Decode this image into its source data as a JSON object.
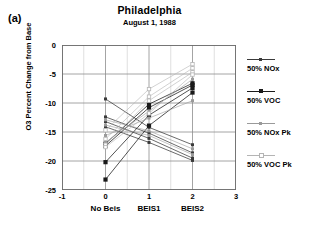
{
  "panel_label": "(a)",
  "chart_data": {
    "type": "line",
    "title": "Philadelphia",
    "subtitle": "August 1, 1988",
    "xlabel": "",
    "ylabel": "O3 Percent Change from Base",
    "xlim": [
      -1,
      3
    ],
    "ylim": [
      -25,
      0
    ],
    "xticks": [
      -1,
      0,
      1,
      2,
      3
    ],
    "xtick_labels": [
      "-1",
      "0",
      "1",
      "2",
      "3"
    ],
    "category_labels": [
      {
        "x": 0,
        "label": "No Beis"
      },
      {
        "x": 1,
        "label": "BEIS1"
      },
      {
        "x": 2,
        "label": "BEIS2"
      }
    ],
    "yticks": [
      0,
      -5,
      -10,
      -15,
      -20,
      -25
    ],
    "ytick_labels": [
      "0",
      "-5",
      "-10",
      "-15",
      "-20",
      "-25"
    ],
    "yminor_step": 2.5,
    "xminor_step": 0.5,
    "grid": true,
    "legend_position": "right",
    "x": [
      0,
      1,
      2
    ],
    "series": [
      {
        "name": "50% NOx",
        "style": "nox",
        "color": "#3a3a3a",
        "marker": "small-filled-square",
        "values": [
          -9.3,
          -14.2,
          -17.2
        ]
      },
      {
        "name": "50% NOx",
        "style": "nox",
        "color": "#3a3a3a",
        "marker": "small-filled-square",
        "values": [
          -12.4,
          -15.2,
          -18.6
        ]
      },
      {
        "name": "50% NOx",
        "style": "nox",
        "color": "#3a3a3a",
        "marker": "small-filled-square",
        "values": [
          -13.2,
          -16.1,
          -19.5
        ]
      },
      {
        "name": "50% NOx",
        "style": "nox",
        "color": "#3a3a3a",
        "marker": "small-filled-square",
        "values": [
          -14.1,
          -16.8,
          -19.9
        ]
      },
      {
        "name": "50% VOC",
        "style": "voc",
        "color": "#1a1a1a",
        "marker": "filled-square",
        "values": [
          -17.0,
          -10.2,
          -6.6
        ]
      },
      {
        "name": "50% VOC",
        "style": "voc",
        "color": "#1a1a1a",
        "marker": "filled-square",
        "values": [
          -17.4,
          -10.8,
          -6.9
        ]
      },
      {
        "name": "50% VOC",
        "style": "voc",
        "color": "#1a1a1a",
        "marker": "filled-square",
        "values": [
          -20.2,
          -12.1,
          -7.4
        ]
      },
      {
        "name": "50% VOC",
        "style": "voc",
        "color": "#1a1a1a",
        "marker": "filled-square",
        "values": [
          -23.2,
          -13.9,
          -8.2
        ]
      },
      {
        "name": "50% NOx Pk",
        "style": "noxpk",
        "color": "#9a9a9a",
        "marker": "small-gray-square",
        "values": [
          -12.9,
          -14.8,
          -17.9
        ]
      },
      {
        "name": "50% NOx Pk",
        "style": "noxpk",
        "color": "#9a9a9a",
        "marker": "small-gray-square",
        "values": [
          -13.8,
          -15.6,
          -18.9
        ]
      },
      {
        "name": "50% NOx Pk",
        "style": "noxpk",
        "color": "#9a9a9a",
        "marker": "small-gray-square",
        "values": [
          -15.6,
          -12.6,
          -9.6
        ]
      },
      {
        "name": "50% NOx Pk",
        "style": "noxpk",
        "color": "#9a9a9a",
        "marker": "small-gray-square",
        "values": [
          -16.8,
          -11.4,
          -5.9
        ]
      },
      {
        "name": "50% VOC Pk",
        "style": "vocpk",
        "color": "#b4b4b4",
        "marker": "open-square",
        "values": [
          -14.7,
          -7.6,
          -3.3
        ]
      },
      {
        "name": "50% VOC Pk",
        "style": "vocpk",
        "color": "#b4b4b4",
        "marker": "open-square",
        "values": [
          -16.2,
          -8.9,
          -4.0
        ]
      },
      {
        "name": "50% VOC Pk",
        "style": "vocpk",
        "color": "#b4b4b4",
        "marker": "open-square",
        "values": [
          -17.2,
          -9.6,
          -4.7
        ]
      },
      {
        "name": "50% VOC Pk",
        "style": "vocpk",
        "color": "#b4b4b4",
        "marker": "open-square",
        "values": [
          -17.6,
          -11.8,
          -5.1
        ]
      }
    ],
    "legend": [
      {
        "label": "50% NOx",
        "color": "#3a3a3a",
        "marker": "small-filled-square"
      },
      {
        "label": "50% VOC",
        "color": "#1a1a1a",
        "marker": "filled-square"
      },
      {
        "label": "50% NOx Pk",
        "color": "#9a9a9a",
        "marker": "small-gray-square"
      },
      {
        "label": "50% VOC Pk",
        "color": "#b4b4b4",
        "marker": "open-square"
      }
    ]
  }
}
